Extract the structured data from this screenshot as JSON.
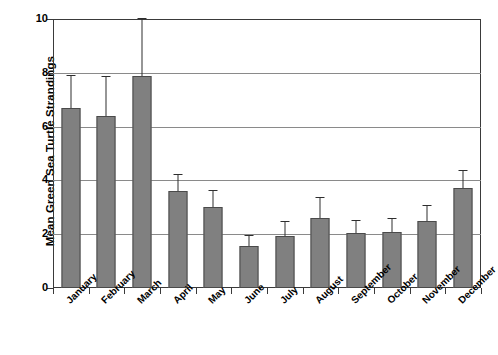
{
  "chart_data": {
    "type": "bar",
    "title": "",
    "xlabel": "",
    "ylabel": "Mean Green Sea Turtle Strandings",
    "ylim": [
      0,
      10
    ],
    "yticks": [
      0,
      2,
      4,
      6,
      8,
      10
    ],
    "ytick_labels": [
      "0",
      "2",
      "4",
      "6",
      "8",
      "10"
    ],
    "grid": true,
    "legend": "none",
    "error_bars": "upper-only",
    "categories": [
      "January",
      "February",
      "March",
      "April",
      "May",
      "June",
      "July",
      "August",
      "September",
      "October",
      "November",
      "December"
    ],
    "values": [
      6.7,
      6.4,
      7.9,
      3.6,
      3.0,
      1.55,
      1.95,
      2.6,
      2.05,
      2.1,
      2.5,
      3.7
    ],
    "errors": [
      1.2,
      1.45,
      2.1,
      0.6,
      0.6,
      0.4,
      0.5,
      0.75,
      0.45,
      0.45,
      0.55,
      0.65
    ],
    "bar_color": "#808080",
    "bar_edge_color": "#4a4a4a",
    "grid_color": "#8a8a8a",
    "axis_color": "#3a3a3a",
    "error_bar_color": "#2e2e2e"
  }
}
